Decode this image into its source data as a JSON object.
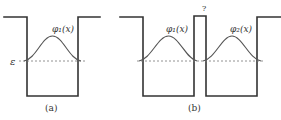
{
  "figure": {
    "panel_a": {
      "caption": "(a)",
      "energy_label": "ε",
      "wavefunction_label": "φ₁(x)"
    },
    "panel_b": {
      "caption": "(b)",
      "barrier_label": "?",
      "wavefunction_left_label": "φ₁(x)",
      "wavefunction_right_label": "φ₂(x)"
    },
    "colors": {
      "line": "#333333",
      "wave": "#555555",
      "dashed": "#777777",
      "background": "#ffffff"
    }
  }
}
